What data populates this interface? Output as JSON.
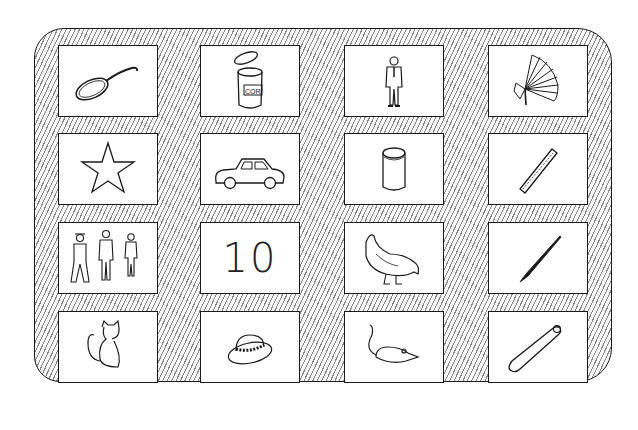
{
  "board": {
    "rows": 4,
    "columns": 4,
    "background": "hatched",
    "stroke_color": "#1a1a1a"
  },
  "cards": [
    {
      "row": 1,
      "col": 1,
      "picture": "frying-pan"
    },
    {
      "row": 1,
      "col": 2,
      "picture": "open-can",
      "label": "COR"
    },
    {
      "row": 1,
      "col": 3,
      "picture": "man-in-suit"
    },
    {
      "row": 1,
      "col": 4,
      "picture": "folding-fan"
    },
    {
      "row": 2,
      "col": 1,
      "picture": "star"
    },
    {
      "row": 2,
      "col": 2,
      "picture": "car"
    },
    {
      "row": 2,
      "col": 3,
      "picture": "cylinder-cup"
    },
    {
      "row": 2,
      "col": 4,
      "picture": "ruler-stick"
    },
    {
      "row": 3,
      "col": 1,
      "picture": "three-people"
    },
    {
      "row": 3,
      "col": 2,
      "picture": "number",
      "text": "10"
    },
    {
      "row": 3,
      "col": 3,
      "picture": "hen"
    },
    {
      "row": 3,
      "col": 4,
      "picture": "pen-nib"
    },
    {
      "row": 4,
      "col": 1,
      "picture": "cat"
    },
    {
      "row": 4,
      "col": 2,
      "picture": "hat"
    },
    {
      "row": 4,
      "col": 3,
      "picture": "mouse"
    },
    {
      "row": 4,
      "col": 4,
      "picture": "baseball-bat"
    }
  ]
}
